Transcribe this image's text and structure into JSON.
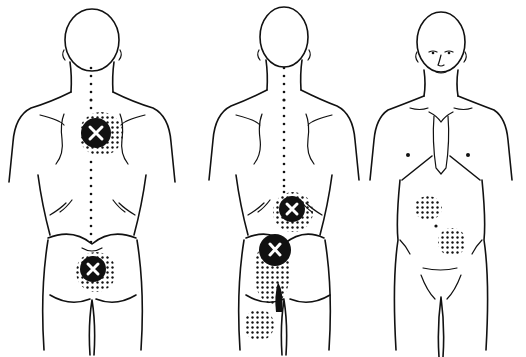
{
  "figure": {
    "colors": {
      "ink": "#111111",
      "background": "#ffffff",
      "marker_x": "#ffffff"
    },
    "figures": [
      {
        "id": "back-view-1",
        "view": "posterior",
        "trigger_points": [
          {
            "label": "x",
            "cx": 96,
            "cy": 133
          },
          {
            "label": "x",
            "cx": 93,
            "cy": 269
          }
        ]
      },
      {
        "id": "back-view-2",
        "view": "posterior",
        "trigger_points": [
          {
            "label": "x",
            "cx": 292,
            "cy": 209
          },
          {
            "label": "x",
            "cx": 277,
            "cy": 249
          }
        ]
      },
      {
        "id": "front-view",
        "view": "anterior",
        "trigger_points": []
      }
    ]
  }
}
